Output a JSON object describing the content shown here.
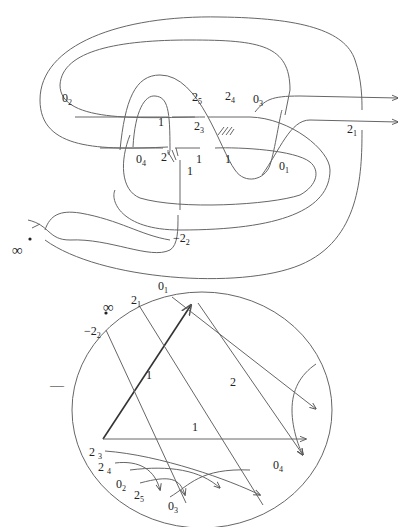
{
  "figure": {
    "top": {
      "title": "knot diagram with crossing labels",
      "labels": [
        {
          "id": "l02",
          "text": "0",
          "sub": "2",
          "x": 62,
          "y": 100
        },
        {
          "id": "l25",
          "text": "2",
          "sub": "5",
          "x": 192,
          "y": 100
        },
        {
          "id": "l24",
          "text": "2",
          "sub": "4",
          "x": 225,
          "y": 100
        },
        {
          "id": "l03",
          "text": "0",
          "sub": "3",
          "x": 253,
          "y": 102
        },
        {
          "id": "l1a",
          "text": "1",
          "sub": "",
          "x": 158,
          "y": 118
        },
        {
          "id": "l23",
          "text": "2",
          "sub": "3",
          "x": 194,
          "y": 122
        },
        {
          "id": "l21",
          "text": "2",
          "sub": "1",
          "x": 347,
          "y": 124
        },
        {
          "id": "l04",
          "text": "0",
          "sub": "4",
          "x": 136,
          "y": 153
        },
        {
          "id": "l2",
          "text": "2",
          "sub": "",
          "x": 161,
          "y": 151
        },
        {
          "id": "l1b",
          "text": "1",
          "sub": "",
          "x": 196,
          "y": 153
        },
        {
          "id": "l1c",
          "text": "1",
          "sub": "",
          "x": 225,
          "y": 153
        },
        {
          "id": "l01",
          "text": "0",
          "sub": "1",
          "x": 279,
          "y": 160
        },
        {
          "id": "l1d",
          "text": "1",
          "sub": "",
          "x": 187,
          "y": 164
        },
        {
          "id": "lm22",
          "text": "−2",
          "sub": "2",
          "x": 172,
          "y": 232
        },
        {
          "id": "linf",
          "text": "∞",
          "sub": "",
          "x": 13,
          "y": 244
        }
      ]
    },
    "bottom": {
      "title": "Gauss chord diagram",
      "sign_label": "—",
      "labels": [
        {
          "id": "c01",
          "text": "0",
          "sub": "1",
          "x": 158,
          "y": 280
        },
        {
          "id": "c21",
          "text": "2",
          "sub": "1",
          "x": 130,
          "y": 293
        },
        {
          "id": "cinf",
          "text": "∞",
          "sub": "",
          "x": 103,
          "y": 307
        },
        {
          "id": "cm22",
          "text": "−2",
          "sub": "2",
          "x": 84,
          "y": 325
        },
        {
          "id": "c1a",
          "text": "1",
          "sub": "",
          "x": 145,
          "y": 368
        },
        {
          "id": "c2",
          "text": "2",
          "sub": "",
          "x": 230,
          "y": 375
        },
        {
          "id": "c1b",
          "text": "1",
          "sub": "",
          "x": 192,
          "y": 422
        },
        {
          "id": "c23",
          "text": "2",
          "sub": "3",
          "x": 89,
          "y": 446
        },
        {
          "id": "c24",
          "text": "2",
          "sub": "4",
          "x": 98,
          "y": 461
        },
        {
          "id": "c04",
          "text": "0",
          "sub": "4",
          "x": 273,
          "y": 461
        },
        {
          "id": "c02",
          "text": "0",
          "sub": "2",
          "x": 115,
          "y": 479
        },
        {
          "id": "c25",
          "text": "2",
          "sub": "5",
          "x": 133,
          "y": 489
        },
        {
          "id": "c03",
          "text": "0",
          "sub": "3",
          "x": 168,
          "y": 501
        }
      ]
    },
    "colors": {
      "stroke": "#555555",
      "text": "#222222",
      "bg": "#ffffff"
    }
  }
}
